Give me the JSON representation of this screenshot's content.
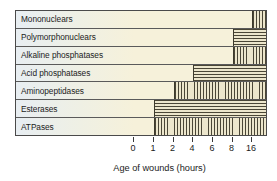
{
  "chart_data": {
    "type": "bar",
    "orientation": "horizontal",
    "title": "",
    "xlabel": "Age of wounds (hours)",
    "ylabel": "",
    "grid": false,
    "legend": null,
    "x_tick_labels": [
      "0",
      "1",
      "2",
      "4",
      "6",
      "8",
      "16"
    ],
    "x_tick_values": [
      0,
      1,
      2,
      4,
      6,
      8,
      16
    ],
    "x_axis_note": "ordinal/non-linear spacing: ticks evenly spaced",
    "categories": [
      "Mononuclears",
      "Polymorphonuclears",
      "Alkaline phosphatases",
      "Acid phosphatases",
      "Aminopeptidases",
      "Esterases",
      "ATPases"
    ],
    "bars": [
      {
        "category": "Mononuclears",
        "start_label": "16",
        "end_label": "beyond 16",
        "start_tick_index": 6,
        "end_tick_index": 7,
        "hatch": "vertical"
      },
      {
        "category": "Polymorphonuclears",
        "start_label": "8",
        "end_label": "beyond 16",
        "start_tick_index": 5,
        "end_tick_index": 7,
        "hatch": "horizontal"
      },
      {
        "category": "Alkaline phosphatases",
        "start_label": "8",
        "end_label": "beyond 16",
        "start_tick_index": 5,
        "end_tick_index": 7,
        "hatch": "vertical"
      },
      {
        "category": "Acid phosphatases",
        "start_label": "4",
        "end_label": "beyond 16",
        "start_tick_index": 3,
        "end_tick_index": 7,
        "hatch": "horizontal"
      },
      {
        "category": "Aminopeptidases",
        "start_label": "2",
        "end_label": "beyond 16",
        "start_tick_index": 2,
        "end_tick_index": 7,
        "hatch": "vertical"
      },
      {
        "category": "Esterases",
        "start_label": "1",
        "end_label": "beyond 16",
        "start_tick_index": 1,
        "end_tick_index": 7,
        "hatch": "horizontal"
      },
      {
        "category": "ATPases",
        "start_label": "1",
        "end_label": "beyond 16",
        "start_tick_index": 1,
        "end_tick_index": 7,
        "hatch": "vertical"
      }
    ],
    "colors": {
      "plot_background": "#f6f1da",
      "label_background": "#e8eef2",
      "hatch_line": "#4a4636",
      "frame": "#4a4a4a",
      "text": "#1b1b1b"
    }
  }
}
